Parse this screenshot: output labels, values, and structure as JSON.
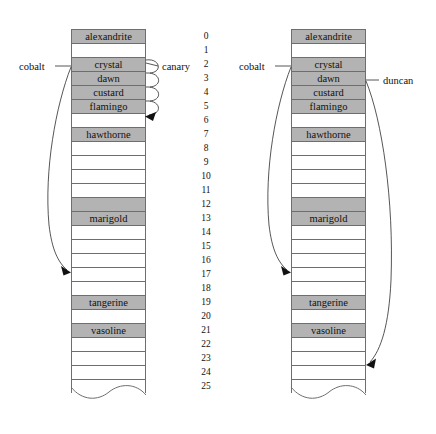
{
  "figure": {
    "type": "diagram",
    "row_height": 14,
    "table_width": 75,
    "slot_count": 26,
    "colors": {
      "filled_slot": "#b3b3b3",
      "empty_slot": "#ffffff",
      "border": "#6e6e6e",
      "ink": "#2b2b2b"
    }
  },
  "index_column": {
    "name": "slot-index",
    "values": [
      "0",
      "1",
      "2",
      "3",
      "4",
      "5",
      "6",
      "7",
      "8",
      "9",
      "10",
      "11",
      "12",
      "13",
      "14",
      "15",
      "16",
      "17",
      "18",
      "19",
      "20",
      "21",
      "22",
      "23",
      "24",
      "25"
    ]
  },
  "left_table": {
    "name": "left-hash-table",
    "x": 71,
    "y": 29,
    "slots": [
      {
        "index": 0,
        "label": "alexandrite",
        "filled": true
      },
      {
        "index": 1,
        "label": "",
        "filled": false
      },
      {
        "index": 2,
        "label": "crystal",
        "filled": true
      },
      {
        "index": 3,
        "label": "dawn",
        "filled": true
      },
      {
        "index": 4,
        "label": "custard",
        "filled": true
      },
      {
        "index": 5,
        "label": "flamingo",
        "filled": true
      },
      {
        "index": 6,
        "label": "",
        "filled": false
      },
      {
        "index": 7,
        "label": "hawthorne",
        "filled": true
      },
      {
        "index": 8,
        "label": "",
        "filled": false
      },
      {
        "index": 9,
        "label": "",
        "filled": false
      },
      {
        "index": 10,
        "label": "",
        "filled": false
      },
      {
        "index": 11,
        "label": "",
        "filled": false
      },
      {
        "index": 12,
        "label": "",
        "filled": true
      },
      {
        "index": 13,
        "label": "marigold",
        "filled": true
      },
      {
        "index": 14,
        "label": "",
        "filled": false
      },
      {
        "index": 15,
        "label": "",
        "filled": false
      },
      {
        "index": 16,
        "label": "",
        "filled": false
      },
      {
        "index": 17,
        "label": "",
        "filled": false
      },
      {
        "index": 18,
        "label": "",
        "filled": false
      },
      {
        "index": 19,
        "label": "tangerine",
        "filled": true
      },
      {
        "index": 20,
        "label": "",
        "filled": false
      },
      {
        "index": 21,
        "label": "vasoline",
        "filled": true
      },
      {
        "index": 22,
        "label": "",
        "filled": false
      },
      {
        "index": 23,
        "label": "",
        "filled": false
      },
      {
        "index": 24,
        "label": "",
        "filled": false
      },
      {
        "index": 25,
        "label": "",
        "filled": false
      }
    ],
    "annotations": [
      {
        "name": "cobalt-label",
        "text": "cobalt",
        "attaches_at_slot": 2,
        "points_to_slot": 17
      },
      {
        "name": "canary-label",
        "text": "canary",
        "attaches_at_slot": 2,
        "points_to_slot": 6,
        "probe_loops": 4
      }
    ]
  },
  "right_table": {
    "name": "right-hash-table",
    "x": 291,
    "y": 29,
    "slots": [
      {
        "index": 0,
        "label": "alexandrite",
        "filled": true
      },
      {
        "index": 1,
        "label": "",
        "filled": false
      },
      {
        "index": 2,
        "label": "crystal",
        "filled": true
      },
      {
        "index": 3,
        "label": "dawn",
        "filled": true
      },
      {
        "index": 4,
        "label": "custard",
        "filled": true
      },
      {
        "index": 5,
        "label": "flamingo",
        "filled": true
      },
      {
        "index": 6,
        "label": "",
        "filled": false
      },
      {
        "index": 7,
        "label": "hawthorne",
        "filled": true
      },
      {
        "index": 8,
        "label": "",
        "filled": false
      },
      {
        "index": 9,
        "label": "",
        "filled": false
      },
      {
        "index": 10,
        "label": "",
        "filled": false
      },
      {
        "index": 11,
        "label": "",
        "filled": false
      },
      {
        "index": 12,
        "label": "",
        "filled": true
      },
      {
        "index": 13,
        "label": "marigold",
        "filled": true
      },
      {
        "index": 14,
        "label": "",
        "filled": false
      },
      {
        "index": 15,
        "label": "",
        "filled": false
      },
      {
        "index": 16,
        "label": "",
        "filled": false
      },
      {
        "index": 17,
        "label": "",
        "filled": false
      },
      {
        "index": 18,
        "label": "",
        "filled": false
      },
      {
        "index": 19,
        "label": "tangerine",
        "filled": true
      },
      {
        "index": 20,
        "label": "",
        "filled": false
      },
      {
        "index": 21,
        "label": "vasoline",
        "filled": true
      },
      {
        "index": 22,
        "label": "",
        "filled": false
      },
      {
        "index": 23,
        "label": "",
        "filled": false
      },
      {
        "index": 24,
        "label": "",
        "filled": false
      },
      {
        "index": 25,
        "label": "",
        "filled": false
      }
    ],
    "annotations": [
      {
        "name": "cobalt-label",
        "text": "cobalt",
        "attaches_at_slot": 2,
        "points_to_slot": 17
      },
      {
        "name": "duncan-label",
        "text": "duncan",
        "attaches_at_slot": 3,
        "points_to_slot": 24
      }
    ]
  }
}
